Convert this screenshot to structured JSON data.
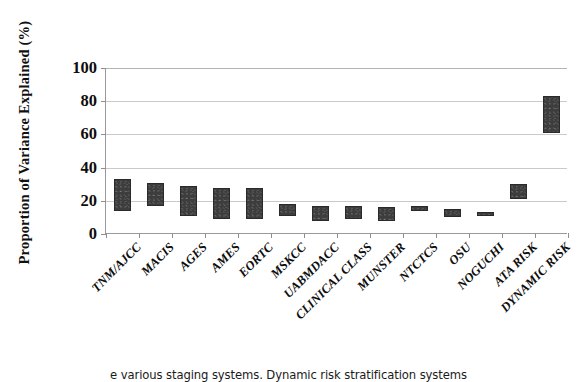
{
  "chart_data": {
    "type": "bar",
    "title": "",
    "xlabel": "",
    "ylabel": "Proportion of Variance Explained (%)",
    "ylim": [
      0,
      100
    ],
    "yticks": [
      0,
      20,
      40,
      60,
      80,
      100
    ],
    "ytick_labels": [
      "0",
      "20",
      "40",
      "60",
      "80",
      "100"
    ],
    "grid": true,
    "legend": "none",
    "bar_style": "floating range bars (low-high interval)",
    "bar_color": "#3d3d3d",
    "categories": [
      "TNM/AJCC",
      "MACIS",
      "AGES",
      "AMES",
      "EORTC",
      "MSKCC",
      "UABMDACC",
      "CLINICAL CLASS",
      "MUNSTER",
      "NTCTCS",
      "OSU",
      "NOGUCHI",
      "ATA RISK",
      "DYNAMIC RISK"
    ],
    "series": [
      {
        "name": "Variance explained range (low)",
        "values": [
          14,
          17,
          11,
          9,
          9,
          11,
          8,
          9,
          8,
          14,
          10,
          11,
          21,
          61
        ]
      },
      {
        "name": "Variance explained range (high)",
        "values": [
          33,
          31,
          29,
          28,
          28,
          18,
          17,
          17,
          16,
          17,
          15,
          13,
          30,
          83
        ]
      }
    ],
    "ranges": [
      {
        "category": "TNM/AJCC",
        "low": 14,
        "high": 33
      },
      {
        "category": "MACIS",
        "low": 17,
        "high": 31
      },
      {
        "category": "AGES",
        "low": 11,
        "high": 29
      },
      {
        "category": "AMES",
        "low": 9,
        "high": 28
      },
      {
        "category": "EORTC",
        "low": 9,
        "high": 28
      },
      {
        "category": "MSKCC",
        "low": 11,
        "high": 18
      },
      {
        "category": "UABMDACC",
        "low": 8,
        "high": 17
      },
      {
        "category": "CLINICAL CLASS",
        "low": 9,
        "high": 17
      },
      {
        "category": "MUNSTER",
        "low": 8,
        "high": 16
      },
      {
        "category": "NTCTCS",
        "low": 14,
        "high": 17
      },
      {
        "category": "OSU",
        "low": 10,
        "high": 15
      },
      {
        "category": "NOGUCHI",
        "low": 11,
        "high": 13
      },
      {
        "category": "ATA RISK",
        "low": 21,
        "high": 30
      },
      {
        "category": "DYNAMIC RISK",
        "low": 61,
        "high": 83
      }
    ]
  },
  "caption": {
    "text": "e various staging systems. Dynamic risk stratification systems"
  }
}
